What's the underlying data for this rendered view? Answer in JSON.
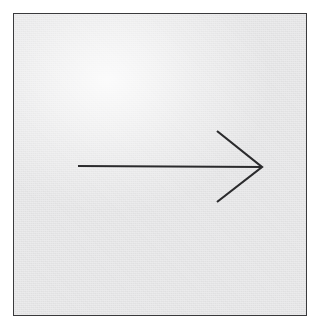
{
  "figure": {
    "caption": "",
    "canvas": {
      "width": 319,
      "height": 334
    },
    "background_color": "#ffffff",
    "panel": {
      "x": 13,
      "y": 13,
      "width": 294,
      "height": 303,
      "fill_color": "#ebebec",
      "border_color": "#3a3a3c",
      "border_width": 1.6
    },
    "arrow": {
      "name": "right-arrow",
      "direction": "right",
      "stroke_color": "#2b2b2d",
      "stroke_width": 2.2,
      "shaft": {
        "x1": 64,
        "y1": 152,
        "x2": 247,
        "y2": 153
      },
      "head": {
        "style": "open-chevron",
        "tip": {
          "x": 248,
          "y": 153
        },
        "upper_barb_end": {
          "x": 203,
          "y": 117
        },
        "lower_barb_end": {
          "x": 203,
          "y": 188
        }
      }
    }
  }
}
